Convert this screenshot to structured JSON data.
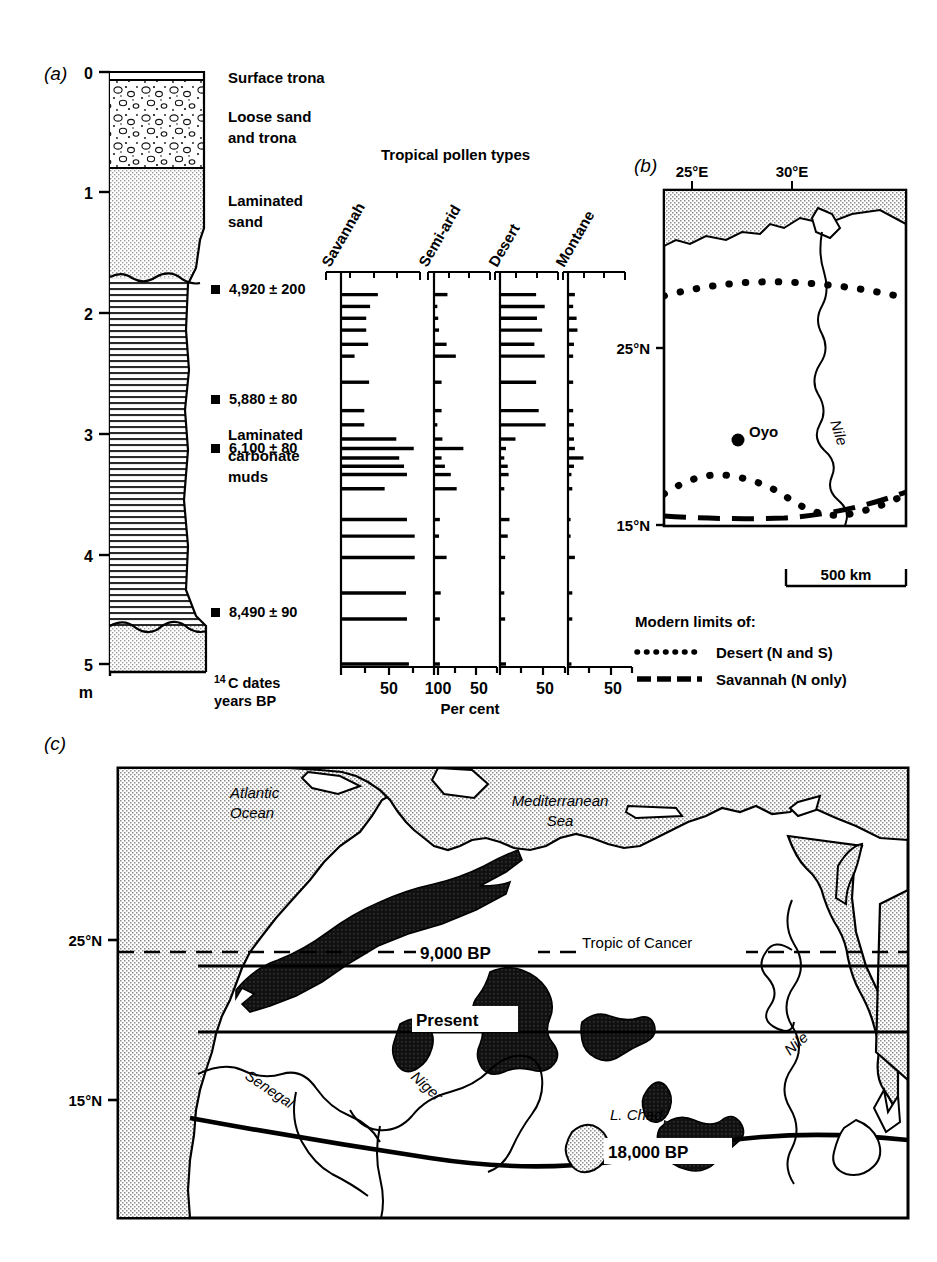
{
  "figure": {
    "panels": [
      "(a)",
      "(b)",
      "(c)"
    ]
  },
  "panel_a": {
    "id": "(a)",
    "depth_unit": "m",
    "depth_ticks": [
      "0",
      "1",
      "2",
      "3",
      "4",
      "5"
    ],
    "lithology_labels": [
      "Surface trona",
      "Loose sand\nand trona",
      "Laminated\nsand",
      "Laminated\ncarbonate\nmuds"
    ],
    "lithology": [
      {
        "name": "Surface trona",
        "label": "Surface trona",
        "from_m": 0.0,
        "to_m": 0.05,
        "pattern": "blank"
      },
      {
        "name": "Loose sand and trona",
        "label_line1": "Loose sand",
        "label_line2": "and trona",
        "from_m": 0.05,
        "to_m": 0.78,
        "pattern": "pebbles"
      },
      {
        "name": "Laminated sand",
        "label_line1": "Laminated",
        "label_line2": "sand",
        "from_m": 0.78,
        "to_m": 1.72,
        "pattern": "stipple"
      },
      {
        "name": "Laminated carbonate muds",
        "label_line1": "Laminated",
        "label_line2": "carbonate",
        "label_line3": "muds",
        "from_m": 1.72,
        "to_m": 5.05,
        "pattern": "horizontal-lines"
      },
      {
        "name": "Basal sand",
        "label": "",
        "from_m": 5.05,
        "to_m": 5.35,
        "pattern": "stipple"
      }
    ],
    "dates_caption_line1": "C dates",
    "dates_caption_sup": "14",
    "dates_caption_line2": "years BP",
    "radiocarbon_dates": [
      {
        "label": "4,920 ± 200",
        "depth_m": 1.78
      },
      {
        "label": "5,880 ± 80",
        "depth_m": 2.72
      },
      {
        "label": "6,100 ± 80",
        "depth_m": 3.13
      },
      {
        "label": "8,490 ± 90",
        "depth_m": 4.5
      }
    ],
    "pollen": {
      "title": "Tropical pollen types",
      "axis_label": "Per cent",
      "columns": [
        {
          "name": "Savannah",
          "axis_ticks": [
            "50",
            "100"
          ],
          "axis_max": 125
        },
        {
          "name": "Semi-arid",
          "axis_ticks": [
            "50"
          ],
          "axis_max": 80
        },
        {
          "name": "Desert",
          "axis_ticks": [
            "50"
          ],
          "axis_max": 80
        },
        {
          "name": "Montane",
          "axis_ticks": [
            "50"
          ],
          "axis_max": 80
        }
      ],
      "samples": [
        {
          "depth_m": 1.88,
          "savannah": 38,
          "semiarid": 16,
          "desert": 42,
          "montane": 8
        },
        {
          "depth_m": 1.98,
          "savannah": 30,
          "semiarid": 4,
          "desert": 52,
          "montane": 6
        },
        {
          "depth_m": 2.08,
          "savannah": 26,
          "semiarid": 5,
          "desert": 43,
          "montane": 10
        },
        {
          "depth_m": 2.18,
          "savannah": 26,
          "semiarid": 6,
          "desert": 49,
          "montane": 11
        },
        {
          "depth_m": 2.3,
          "savannah": 28,
          "semiarid": 15,
          "desert": 40,
          "montane": 7
        },
        {
          "depth_m": 2.4,
          "savannah": 14,
          "semiarid": 26,
          "desert": 52,
          "montane": 6
        },
        {
          "depth_m": 2.62,
          "savannah": 29,
          "semiarid": 9,
          "desert": 42,
          "montane": 6
        },
        {
          "depth_m": 2.86,
          "savannah": 24,
          "semiarid": 9,
          "desert": 45,
          "montane": 6
        },
        {
          "depth_m": 2.98,
          "savannah": 24,
          "semiarid": 4,
          "desert": 53,
          "montane": 7
        },
        {
          "depth_m": 3.1,
          "savannah": 57,
          "semiarid": 10,
          "desert": 18,
          "montane": 7
        },
        {
          "depth_m": 3.18,
          "savannah": 75,
          "semiarid": 35,
          "desert": 7,
          "montane": 8
        },
        {
          "depth_m": 3.26,
          "savannah": 60,
          "semiarid": 9,
          "desert": 5,
          "montane": 18
        },
        {
          "depth_m": 3.33,
          "savannah": 65,
          "semiarid": 13,
          "desert": 9,
          "montane": 7
        },
        {
          "depth_m": 3.4,
          "savannah": 68,
          "semiarid": 20,
          "desert": 10,
          "montane": 4
        },
        {
          "depth_m": 3.52,
          "savannah": 45,
          "semiarid": 27,
          "desert": 5,
          "montane": 5
        },
        {
          "depth_m": 3.78,
          "savannah": 68,
          "semiarid": 7,
          "desert": 11,
          "montane": 3
        },
        {
          "depth_m": 3.92,
          "savannah": 76,
          "semiarid": 6,
          "desert": 9,
          "montane": 3
        },
        {
          "depth_m": 4.1,
          "savannah": 76,
          "semiarid": 15,
          "desert": 6,
          "montane": 8
        },
        {
          "depth_m": 4.4,
          "savannah": 67,
          "semiarid": 8,
          "desert": 5,
          "montane": 5
        },
        {
          "depth_m": 4.62,
          "savannah": 68,
          "semiarid": 7,
          "desert": 6,
          "montane": 5
        },
        {
          "depth_m": 5.0,
          "savannah": 70,
          "semiarid": 7,
          "desert": 7,
          "montane": 4
        }
      ]
    }
  },
  "panel_b": {
    "id": "(b)",
    "lon_labels": [
      "25°E",
      "30°E"
    ],
    "lat_labels": [
      "25°N",
      "15°N"
    ],
    "site_label": "Oyo",
    "river_label": "Nile",
    "scale_label": "500 km",
    "legend_title": "Modern limits of:",
    "legend": [
      {
        "style": "dotted",
        "label": "Desert (N and S)"
      },
      {
        "style": "dashed",
        "label": "Savannah (N only)"
      }
    ]
  },
  "panel_c": {
    "id": "(c)",
    "lat_labels": [
      "25°N",
      "15°N"
    ],
    "ocean_labels": [
      "Atlantic\nOcean",
      "Mediterranean\nSea"
    ],
    "sea_label_1_line1": "Atlantic",
    "sea_label_1_line2": "Ocean",
    "sea_label_2_line1": "Mediterranean",
    "sea_label_2_line2": "Sea",
    "rivers": [
      "Senegal",
      "Niger",
      "Nile"
    ],
    "lake_label": "L. Chad",
    "tropic_label": "Tropic of Cancer",
    "boundary_labels": [
      {
        "label": "9,000 BP",
        "style": "dashed"
      },
      {
        "label": "Present",
        "style": "solid-thin"
      },
      {
        "label": "18,000 BP",
        "style": "solid-thick"
      }
    ]
  },
  "colors": {
    "ink": "#000000",
    "sea_fill": "#d8d8d8",
    "stipple": "#cfcfcf",
    "paper": "#ffffff",
    "dune_fill": "#1a1a1a"
  }
}
